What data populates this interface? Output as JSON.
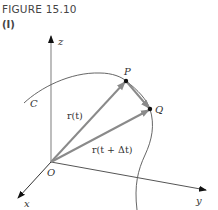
{
  "figure": {
    "title": "FIGURE 15.10",
    "subtitle": "(I)"
  },
  "axes": {
    "z_label": "z",
    "x_label": "x",
    "y_label": "y",
    "origin_label": "O"
  },
  "curve": {
    "label": "C"
  },
  "points": {
    "P": "P",
    "Q": "Q"
  },
  "vectors": {
    "r_t": "r(t)",
    "r_t_dt": "r(t + Δt)"
  },
  "colors": {
    "axis": "#555555",
    "vector": "#8a8a8a",
    "curve": "#555555",
    "text": "#333333"
  }
}
